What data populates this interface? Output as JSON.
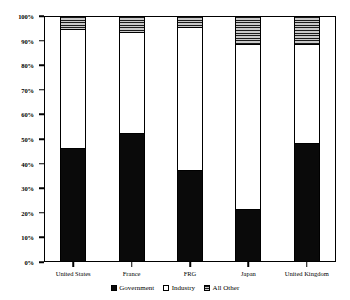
{
  "chart_data": {
    "type": "bar",
    "subtype": "stacked-100-percent",
    "title": "",
    "xlabel": "",
    "ylabel": "",
    "ylim": [
      0,
      100
    ],
    "ytick_labels": [
      "0%",
      "10%",
      "20%",
      "30%",
      "40%",
      "50%",
      "60%",
      "70%",
      "80%",
      "90%",
      "100%"
    ],
    "ytick_values": [
      0,
      10,
      20,
      30,
      40,
      50,
      60,
      70,
      80,
      90,
      100
    ],
    "grid": false,
    "legend_position": "bottom-center",
    "categories": [
      "United States",
      "France",
      "FRG",
      "Japan",
      "United Kingdom"
    ],
    "series": [
      {
        "name": "Government",
        "color": "#0a0a0a",
        "fill": "solid-black",
        "values": [
          46,
          52,
          37,
          21,
          48
        ]
      },
      {
        "name": "Industry",
        "color": "#ffffff",
        "fill": "solid-white",
        "values": [
          49,
          42,
          59,
          68,
          41
        ]
      },
      {
        "name": "All Other",
        "color": "#c9c9c9",
        "fill": "horizontal-hatch",
        "values": [
          5,
          6,
          4,
          11,
          11
        ]
      }
    ]
  },
  "legend": {
    "items": [
      {
        "label": "Government",
        "swatch": "legend-swatch-government"
      },
      {
        "label": "Industry",
        "swatch": "legend-swatch-industry"
      },
      {
        "label": "All Other",
        "swatch": "legend-swatch-allother"
      }
    ]
  }
}
